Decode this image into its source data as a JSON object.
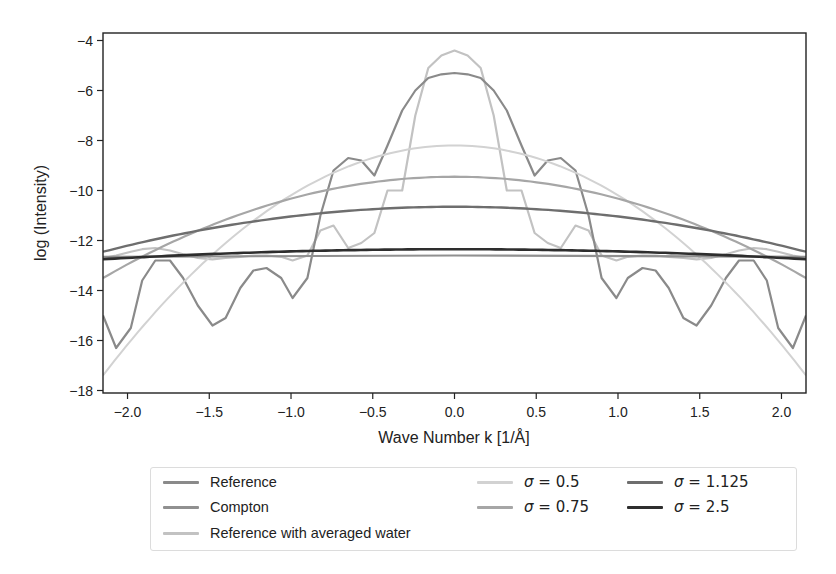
{
  "chart_data": {
    "type": "line",
    "title": "",
    "xlabel": "Wave Number k [1/Å]",
    "ylabel": "log (Intensity)",
    "xlim": [
      -2.15,
      2.15
    ],
    "ylim": [
      -18.1,
      -3.7
    ],
    "xticks": [
      -2.0,
      -1.5,
      -1.0,
      -0.5,
      0.0,
      0.5,
      1.0,
      1.5,
      2.0
    ],
    "xtick_labels": [
      "−2.0",
      "−1.5",
      "−1.0",
      "−0.5",
      "0.0",
      "0.5",
      "1.0",
      "1.5",
      "2.0"
    ],
    "yticks": [
      -4,
      -6,
      -8,
      -10,
      -12,
      -14,
      -16,
      -18
    ],
    "ytick_labels": [
      "−4",
      "−6",
      "−8",
      "−10",
      "−12",
      "−14",
      "−16",
      "−18"
    ],
    "grid": false,
    "legend_position": "below plot, 3 columns",
    "series": [
      {
        "name": "Reference",
        "color": "#8a8a8a",
        "width": 2.2,
        "x": [
          -2.15,
          -2.07,
          -1.98,
          -1.91,
          -1.83,
          -1.74,
          -1.66,
          -1.57,
          -1.48,
          -1.4,
          -1.31,
          -1.23,
          -1.15,
          -1.06,
          -0.99,
          -0.9,
          -0.82,
          -0.74,
          -0.65,
          -0.57,
          -0.49,
          -0.41,
          -0.32,
          -0.24,
          -0.16,
          -0.08,
          0.0,
          0.08,
          0.16,
          0.24,
          0.32,
          0.41,
          0.49,
          0.57,
          0.65,
          0.74,
          0.82,
          0.9,
          0.99,
          1.06,
          1.15,
          1.23,
          1.31,
          1.4,
          1.48,
          1.57,
          1.66,
          1.74,
          1.83,
          1.91,
          1.98,
          2.07,
          2.15
        ],
        "y": [
          -15.0,
          -16.3,
          -15.5,
          -13.6,
          -12.8,
          -12.8,
          -13.5,
          -14.6,
          -15.4,
          -15.1,
          -13.9,
          -13.2,
          -13.1,
          -13.5,
          -14.3,
          -13.5,
          -11.0,
          -9.2,
          -8.7,
          -8.8,
          -9.4,
          -8.2,
          -6.8,
          -6.0,
          -5.5,
          -5.35,
          -5.3,
          -5.35,
          -5.5,
          -6.0,
          -6.8,
          -8.2,
          -9.4,
          -8.8,
          -8.7,
          -9.2,
          -11.0,
          -13.5,
          -14.3,
          -13.5,
          -13.1,
          -13.2,
          -13.9,
          -15.1,
          -15.4,
          -14.6,
          -13.5,
          -12.8,
          -12.8,
          -13.6,
          -15.5,
          -16.3,
          -15.0
        ]
      },
      {
        "name": "Compton",
        "color": "#909090",
        "width": 2.2,
        "x": [
          -2.15,
          0.0,
          2.15
        ],
        "y": [
          -12.65,
          -12.6,
          -12.65
        ]
      },
      {
        "name": "Reference with averaged water",
        "color": "#c2c2c2",
        "width": 2.2,
        "x": [
          -2.15,
          -2.07,
          -1.98,
          -1.91,
          -1.83,
          -1.74,
          -1.66,
          -1.57,
          -1.48,
          -1.4,
          -1.31,
          -1.23,
          -1.15,
          -1.06,
          -0.99,
          -0.9,
          -0.82,
          -0.74,
          -0.65,
          -0.57,
          -0.49,
          -0.41,
          -0.32,
          -0.24,
          -0.16,
          -0.08,
          0.0,
          0.08,
          0.16,
          0.24,
          0.32,
          0.41,
          0.49,
          0.57,
          0.65,
          0.74,
          0.82,
          0.9,
          0.99,
          1.06,
          1.15,
          1.23,
          1.31,
          1.4,
          1.48,
          1.57,
          1.66,
          1.74,
          1.83,
          1.91,
          1.98,
          2.07,
          2.15
        ],
        "y": [
          -12.7,
          -12.6,
          -12.45,
          -12.35,
          -12.3,
          -12.4,
          -12.55,
          -12.7,
          -12.75,
          -12.7,
          -12.65,
          -12.6,
          -12.6,
          -12.65,
          -12.8,
          -12.6,
          -11.6,
          -11.4,
          -12.3,
          -12.1,
          -11.7,
          -10.0,
          -10.0,
          -7.0,
          -5.1,
          -4.6,
          -4.4,
          -4.6,
          -5.1,
          -7.0,
          -10.0,
          -10.0,
          -11.7,
          -12.1,
          -12.3,
          -11.4,
          -11.6,
          -12.6,
          -12.8,
          -12.65,
          -12.6,
          -12.6,
          -12.65,
          -12.7,
          -12.75,
          -12.7,
          -12.55,
          -12.4,
          -12.3,
          -12.35,
          -12.45,
          -12.6,
          -12.7
        ]
      },
      {
        "name": "σ = 0.5",
        "color": "#d2d2d2",
        "width": 2.0,
        "gaussian": {
          "peak": -8.2,
          "edge": -17.4
        }
      },
      {
        "name": "σ = 0.75",
        "color": "#a6a6a6",
        "width": 2.2,
        "gaussian": {
          "peak": -9.45,
          "edge": -13.5
        }
      },
      {
        "name": "σ = 1.125",
        "color": "#6e6e6e",
        "width": 2.4,
        "gaussian": {
          "peak": -10.65,
          "edge": -12.45
        }
      },
      {
        "name": "σ = 2.5",
        "color": "#2e2e2e",
        "width": 2.6,
        "gaussian": {
          "peak": -12.35,
          "edge": -12.75
        }
      }
    ]
  },
  "legend": {
    "items": [
      {
        "label": "Reference",
        "color": "#8a8a8a",
        "math": false
      },
      {
        "label": "Compton",
        "color": "#909090",
        "math": false
      },
      {
        "label": "Reference with averaged water",
        "color": "#c2c2c2",
        "math": false
      },
      {
        "symbol": "σ",
        "value": "= 0.5",
        "color": "#d2d2d2",
        "math": true
      },
      {
        "symbol": "σ",
        "value": "= 0.75",
        "color": "#a6a6a6",
        "math": true
      },
      {
        "symbol": "σ",
        "value": "= 1.125",
        "color": "#6e6e6e",
        "math": true
      },
      {
        "symbol": "σ",
        "value": "= 2.5",
        "color": "#2e2e2e",
        "math": true
      }
    ]
  }
}
